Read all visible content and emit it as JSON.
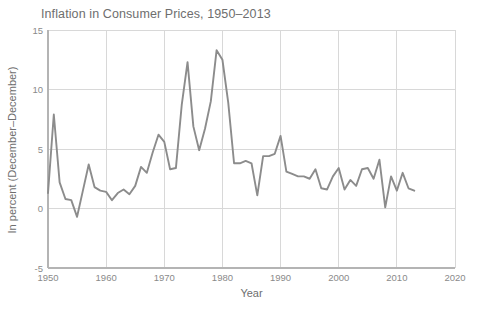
{
  "chart_data": {
    "type": "line",
    "title": "Inflation in Consumer Prices, 1950–2013",
    "xlabel": "Year",
    "ylabel": "In percent (December–December)",
    "xlim": [
      1950,
      2020
    ],
    "ylim": [
      -5,
      15
    ],
    "xticks": [
      1950,
      1960,
      1970,
      1980,
      1990,
      2000,
      2010,
      2020
    ],
    "xtick_labels": [
      "1950",
      "1960",
      "1970",
      "1980",
      "1990",
      "2000",
      "2010",
      "2020"
    ],
    "yticks": [
      -5,
      0,
      5,
      10,
      15
    ],
    "ytick_labels": [
      "-5",
      "0",
      "5",
      "10",
      "15"
    ],
    "grid": true,
    "legend": false,
    "line_color": "#8c8c8c",
    "line_width": 1.9,
    "grid_color": "#d8d8d8",
    "axis_color": "#b4b4b4",
    "text_color": "#6e6e6e",
    "series": [
      {
        "name": "Inflation",
        "x": [
          1950,
          1951,
          1952,
          1953,
          1954,
          1955,
          1956,
          1957,
          1958,
          1959,
          1960,
          1961,
          1962,
          1963,
          1964,
          1965,
          1966,
          1967,
          1968,
          1969,
          1970,
          1971,
          1972,
          1973,
          1974,
          1975,
          1976,
          1977,
          1978,
          1979,
          1980,
          1981,
          1982,
          1983,
          1984,
          1985,
          1986,
          1987,
          1988,
          1989,
          1990,
          1991,
          1992,
          1993,
          1994,
          1995,
          1996,
          1997,
          1998,
          1999,
          2000,
          2001,
          2002,
          2003,
          2004,
          2005,
          2006,
          2007,
          2008,
          2009,
          2010,
          2011,
          2012,
          2013
        ],
        "values": [
          1.3,
          7.9,
          2.2,
          0.8,
          0.7,
          -0.7,
          1.5,
          3.7,
          1.8,
          1.5,
          1.4,
          0.7,
          1.3,
          1.6,
          1.2,
          1.9,
          3.5,
          3.0,
          4.7,
          6.2,
          5.6,
          3.3,
          3.4,
          8.7,
          12.3,
          6.9,
          4.9,
          6.7,
          9.0,
          13.3,
          12.5,
          8.9,
          3.8,
          3.8,
          4.0,
          3.8,
          1.1,
          4.4,
          4.4,
          4.6,
          6.1,
          3.1,
          2.9,
          2.7,
          2.7,
          2.5,
          3.3,
          1.7,
          1.6,
          2.7,
          3.4,
          1.6,
          2.4,
          1.9,
          3.3,
          3.4,
          2.5,
          4.1,
          0.1,
          2.7,
          1.5,
          3.0,
          1.7,
          1.5
        ]
      }
    ]
  },
  "source_note": ""
}
